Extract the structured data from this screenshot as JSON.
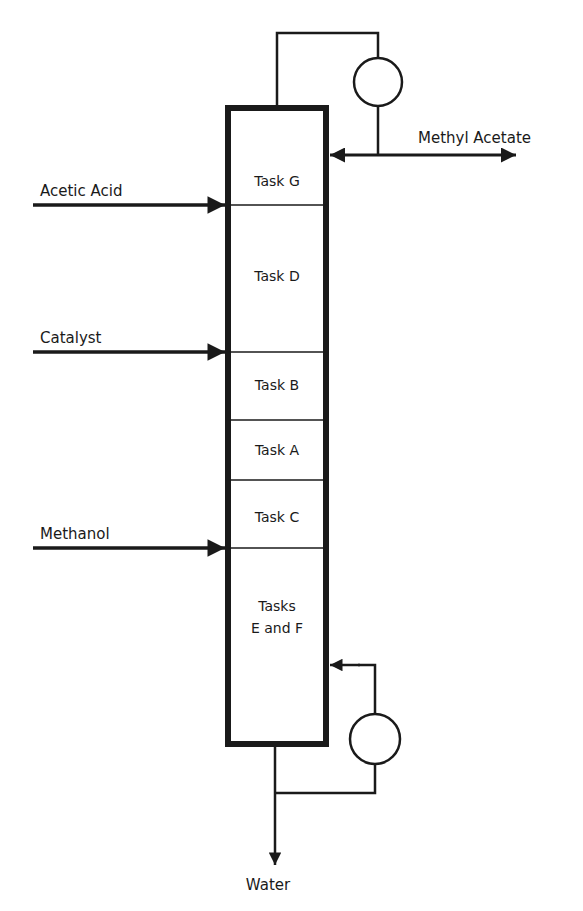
{
  "column": {
    "sections": [
      {
        "id": "G",
        "label_lines": [
          "Task G"
        ]
      },
      {
        "id": "D",
        "label_lines": [
          "Task D"
        ]
      },
      {
        "id": "B",
        "label_lines": [
          "Task B"
        ]
      },
      {
        "id": "A",
        "label_lines": [
          "Task A"
        ]
      },
      {
        "id": "C",
        "label_lines": [
          "Task C"
        ]
      },
      {
        "id": "EF",
        "label_lines": [
          "Tasks",
          "E and F"
        ]
      }
    ]
  },
  "feeds": [
    {
      "name": "acetic-acid",
      "label": "Acetic Acid"
    },
    {
      "name": "catalyst",
      "label": "Catalyst"
    },
    {
      "name": "methanol",
      "label": "Methanol"
    }
  ],
  "products": {
    "top": {
      "label": "Methyl Acetate"
    },
    "bottom": {
      "label": "Water"
    }
  },
  "equipment": {
    "condenser": "condenser-circle",
    "reboiler": "reboiler-circle"
  }
}
